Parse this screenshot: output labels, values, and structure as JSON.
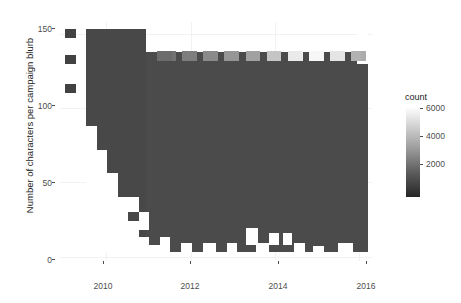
{
  "chart_data": {
    "type": "heatmap",
    "title": "",
    "subtitle": "",
    "xlabel": "",
    "ylabel": "Number of characters per campaign blurb",
    "xlim": [
      2008.9,
      2016.3
    ],
    "ylim": [
      -3,
      158
    ],
    "xticks": [
      2010,
      2012,
      2014,
      2016
    ],
    "xticklabels": [
      "2010",
      "2012",
      "2014",
      "2016"
    ],
    "yticks": [
      0,
      50,
      100,
      150
    ],
    "yticklabels": [
      "0",
      "50",
      "100",
      "150"
    ],
    "grid": true,
    "legend": {
      "title": "count",
      "position": "right",
      "ticks": [
        2000,
        4000,
        6000
      ],
      "ticklabels": [
        "2000",
        "4000",
        "6000"
      ],
      "range": [
        0,
        7200
      ],
      "low_color": "#262626",
      "high_color": "#ffffff"
    },
    "panel_background": "#ffffff",
    "binning": {
      "x_bins": 30,
      "y_bins": 30,
      "x_bin_width": 0.2467,
      "y_bin_width": 5.3667
    },
    "bright_band_y": 135,
    "cells": [
      {
        "x": 2009.1,
        "y": 150,
        "count": 600
      },
      {
        "x": 2009.1,
        "y": 133,
        "count": 600
      },
      {
        "x": 2009.1,
        "y": 113,
        "count": 600
      },
      {
        "x": 2009.4,
        "y": 155,
        "count": 700
      },
      {
        "x": 2009.4,
        "y": 145,
        "count": 700
      },
      {
        "x": 2009.4,
        "y": 120,
        "count": 700
      },
      {
        "x": 2009.4,
        "y": 95,
        "count": 700
      },
      {
        "x": 2009.4,
        "y": 70,
        "count": 700
      },
      {
        "x": 2009.7,
        "y": 155,
        "count": 800
      },
      {
        "x": 2009.7,
        "y": 120,
        "count": 800
      },
      {
        "x": 2009.7,
        "y": 80,
        "count": 800
      },
      {
        "x": 2009.7,
        "y": 45,
        "count": 800
      },
      {
        "x": 2010.5,
        "y": 150,
        "count": 900
      },
      {
        "x": 2011.0,
        "y": 137,
        "count": 1400
      },
      {
        "x": 2011.5,
        "y": 135,
        "count": 2100
      },
      {
        "x": 2012.0,
        "y": 135,
        "count": 2600
      },
      {
        "x": 2012.5,
        "y": 135,
        "count": 3100
      },
      {
        "x": 2013.0,
        "y": 135,
        "count": 3400
      },
      {
        "x": 2013.5,
        "y": 135,
        "count": 3900
      },
      {
        "x": 2014.0,
        "y": 135,
        "count": 5200
      },
      {
        "x": 2014.5,
        "y": 135,
        "count": 6600
      },
      {
        "x": 2015.0,
        "y": 135,
        "count": 6900
      },
      {
        "x": 2015.5,
        "y": 135,
        "count": 6300
      },
      {
        "x": 2016.0,
        "y": 135,
        "count": 4100
      },
      {
        "x": 2012.0,
        "y": 60,
        "count": 900
      },
      {
        "x": 2013.0,
        "y": 60,
        "count": 950
      },
      {
        "x": 2014.0,
        "y": 60,
        "count": 1000
      },
      {
        "x": 2015.0,
        "y": 60,
        "count": 1050
      }
    ]
  }
}
